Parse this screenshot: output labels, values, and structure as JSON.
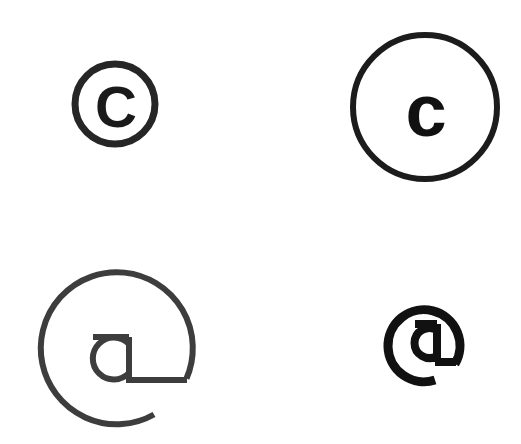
{
  "page": {
    "background_color": "#ffffff",
    "width": 521,
    "height": 444
  },
  "symbols": [
    {
      "id": "copyright-small",
      "name": "copyright-symbol-small",
      "glyph": "C",
      "description": "Small copyright mark: uppercase C inside a thick ring",
      "stroke_color": "#262626",
      "glyph_color": "#1a1a1a",
      "position": {
        "x": 71,
        "y": 58
      },
      "size": {
        "width": 90,
        "height": 92
      },
      "circle": {
        "cx": 44,
        "cy": 46,
        "r": 40,
        "stroke_width": 7
      },
      "glyph_font_size": 58
    },
    {
      "id": "copyright-large",
      "name": "copyright-symbol-large",
      "glyph": "c",
      "description": "Large copyright mark: lowercase c inside a thin wide ring",
      "stroke_color": "#1c1c1c",
      "glyph_color": "#111111",
      "position": {
        "x": 348,
        "y": 30
      },
      "size": {
        "width": 156,
        "height": 156
      },
      "circle": {
        "cx": 77,
        "cy": 77,
        "r": 72,
        "stroke_width": 6
      },
      "glyph_font_size": 74
    },
    {
      "id": "at-large",
      "name": "at-symbol-large",
      "glyph": "a",
      "description": "Large at sign: lowercase a with horizontal tail inside an open ring with gap at lower right",
      "stroke_color": "#3d3d3d",
      "glyph_color": "#3d3d3d",
      "position": {
        "x": 34,
        "y": 262
      },
      "size": {
        "width": 166,
        "height": 166
      },
      "circle": {
        "cx": 80,
        "cy": 83,
        "r": 76,
        "stroke_width": 6,
        "gap_start_deg": 18,
        "gap_end_deg": 58
      },
      "glyph_font_size": 78
    },
    {
      "id": "at-small",
      "name": "at-symbol-small",
      "glyph": "@",
      "description": "Small bold at sign glyph",
      "stroke_color": "#111111",
      "glyph_color": "#111111",
      "position": {
        "x": 383,
        "y": 298
      },
      "size": {
        "width": 90,
        "height": 94
      },
      "circle": {
        "cx": 42,
        "cy": 46,
        "r": 36,
        "stroke_width": 8,
        "gap_start_deg": 8,
        "gap_end_deg": 42
      },
      "glyph_font_size": 44
    }
  ]
}
